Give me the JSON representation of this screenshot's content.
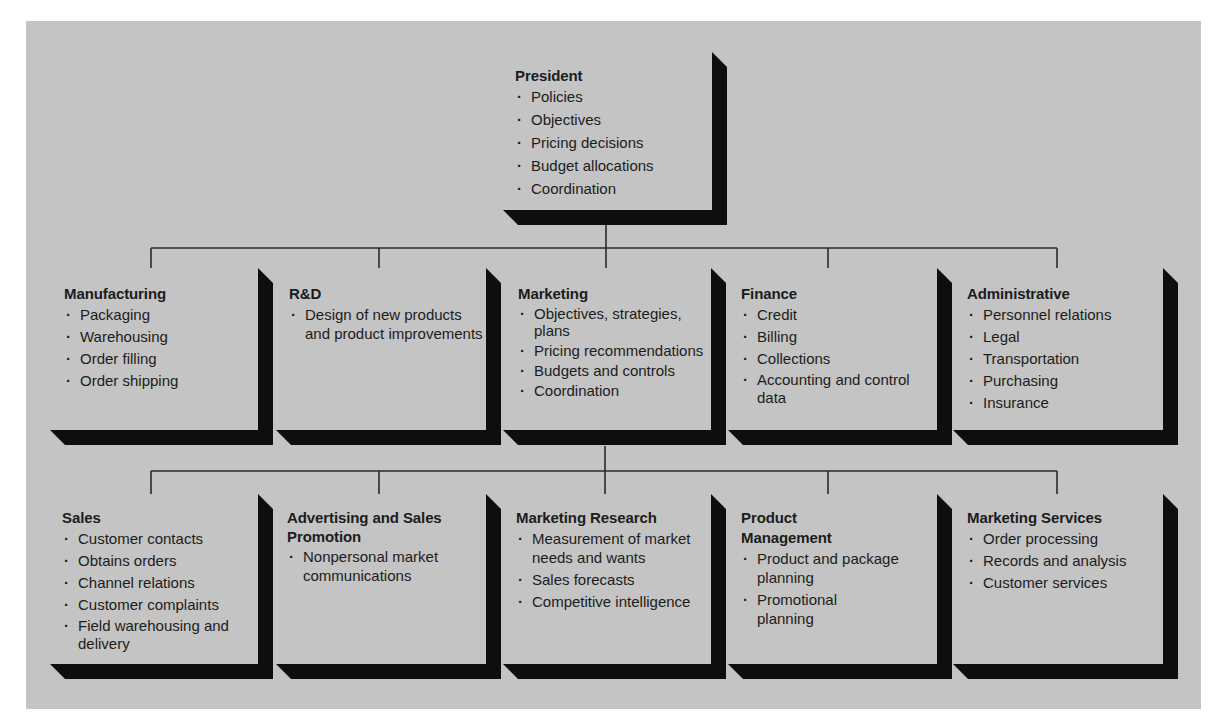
{
  "colors": {
    "background": "#c4c4c4",
    "frame": "#0e0e0e",
    "connector": "#2a2a2a",
    "text": "#1c1c1c"
  },
  "president": {
    "title": "President",
    "items": [
      "Policies",
      "Objectives",
      "Pricing decisions",
      "Budget allocations",
      "Coordination"
    ]
  },
  "departments": [
    {
      "title": "Manufacturing",
      "items": [
        "Packaging",
        "Warehousing",
        "Order filling",
        "Order shipping"
      ]
    },
    {
      "title": "R&D",
      "items": [
        "Design of new products and product improvements"
      ]
    },
    {
      "title": "Marketing",
      "items": [
        "Objectives, strategies, plans",
        "Pricing recommendations",
        "Budgets and controls",
        "Coordination"
      ]
    },
    {
      "title": "Finance",
      "items": [
        "Credit",
        "Billing",
        "Collections",
        "Accounting and control data"
      ]
    },
    {
      "title": "Administrative",
      "items": [
        "Personnel relations",
        "Legal",
        "Transportation",
        "Purchasing",
        "Insurance"
      ]
    }
  ],
  "marketing_units": [
    {
      "title": "Sales",
      "items": [
        "Customer contacts",
        "Obtains orders",
        "Channel relations",
        "Customer complaints",
        "Field warehousing and delivery"
      ]
    },
    {
      "title": "Advertising and Sales Promotion",
      "items": [
        "Nonpersonal market communications"
      ]
    },
    {
      "title": "Marketing Research",
      "items": [
        "Measurement of market needs and wants",
        "Sales forecasts",
        "Competitive intelligence"
      ]
    },
    {
      "title": "Product Management",
      "items": [
        "Product and package planning",
        "Promotional planning"
      ]
    },
    {
      "title": "Marketing Services",
      "items": [
        "Order processing",
        "Records and analysis",
        "Customer services"
      ]
    }
  ]
}
